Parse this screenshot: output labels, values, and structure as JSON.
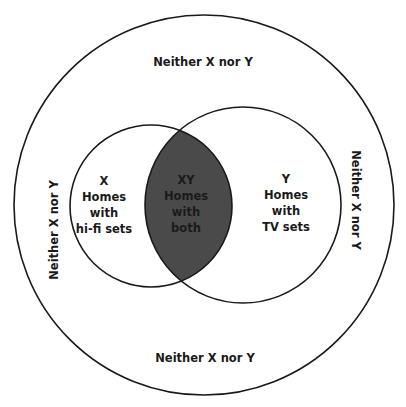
{
  "diagram": {
    "type": "venn",
    "colors": {
      "background": "#ffffff",
      "stroke": "#1a1a1a",
      "intersection_fill": "#4a4a4a",
      "text": "#1a1a1a"
    },
    "universe": {
      "label_top": "Neither X nor Y",
      "label_bottom": "Neither X nor Y",
      "label_left": "Neither X nor Y",
      "label_right": "Neither X nor Y"
    },
    "set_x": {
      "lines": [
        "X",
        "Homes",
        "with",
        "hi-fi sets"
      ]
    },
    "set_y": {
      "lines": [
        "Y",
        "Homes",
        "with",
        "TV sets"
      ]
    },
    "intersection": {
      "lines": [
        "XY",
        "Homes",
        "with",
        "both"
      ]
    }
  }
}
